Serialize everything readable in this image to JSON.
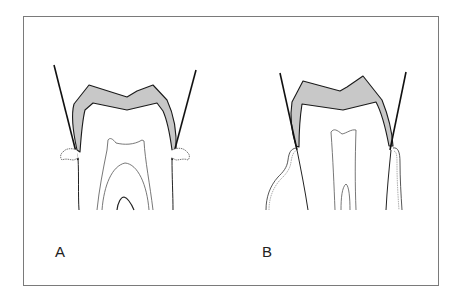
{
  "figure": {
    "panels": [
      {
        "id": "A",
        "label": "A",
        "description": "Tooth crown with enamel layer and tangent lines; small gingival tufts at margins"
      },
      {
        "id": "B",
        "label": "B",
        "description": "Tooth crown with enamel layer and tangent lines; gingiva extending down along root"
      }
    ]
  },
  "colors": {
    "enamel_fill": "#c8c8c8",
    "outline": "#1a1a1a",
    "thin_line": "#555555",
    "frame": "#7a7a7a",
    "background": "#ffffff"
  }
}
